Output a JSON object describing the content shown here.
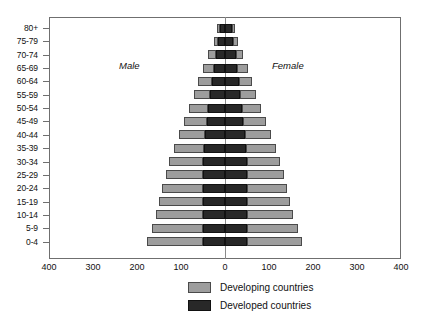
{
  "chart_data": {
    "type": "bar",
    "subtype": "population-pyramid",
    "title": "",
    "xlabel": "",
    "ylabel": "",
    "orientation": "horizontal",
    "stacked": true,
    "grid": false,
    "legend_position": "bottom-center",
    "axis": {
      "x_ticks": [
        "400",
        "300",
        "200",
        "100",
        "0",
        "100",
        "200",
        "300",
        "400"
      ],
      "x_tick_values": [
        -400,
        -300,
        -200,
        -100,
        0,
        100,
        200,
        300,
        400
      ],
      "xlim": [
        -400,
        400
      ],
      "units_per_tick": 100
    },
    "categories": [
      "0-4",
      "5-9",
      "10-14",
      "15-19",
      "20-24",
      "25-29",
      "30-34",
      "35-39",
      "40-44",
      "45-49",
      "50-54",
      "55-59",
      "60-64",
      "65-69",
      "70-74",
      "75-79",
      "80+"
    ],
    "side_labels": {
      "left": "Male",
      "right": "Female"
    },
    "series": [
      {
        "name": "Developing countries",
        "color": "#9d9d9d",
        "male": [
          127,
          117,
          107,
          100,
          93,
          85,
          77,
          69,
          60,
          52,
          44,
          37,
          31,
          24,
          17,
          10,
          6
        ],
        "female": [
          125,
          115,
          105,
          98,
          91,
          83,
          75,
          67,
          59,
          51,
          43,
          36,
          30,
          24,
          17,
          11,
          7
        ]
      },
      {
        "name": "Developed countries",
        "color": "#282828",
        "male": [
          50,
          50,
          50,
          50,
          50,
          50,
          50,
          48,
          45,
          42,
          38,
          34,
          30,
          26,
          21,
          16,
          12
        ],
        "female": [
          50,
          50,
          50,
          50,
          50,
          50,
          50,
          48,
          45,
          42,
          38,
          35,
          32,
          28,
          24,
          19,
          16
        ]
      }
    ],
    "legend": [
      {
        "label": "Developing countries",
        "color": "#9d9d9d"
      },
      {
        "label": "Developed countries",
        "color": "#282828"
      }
    ]
  }
}
